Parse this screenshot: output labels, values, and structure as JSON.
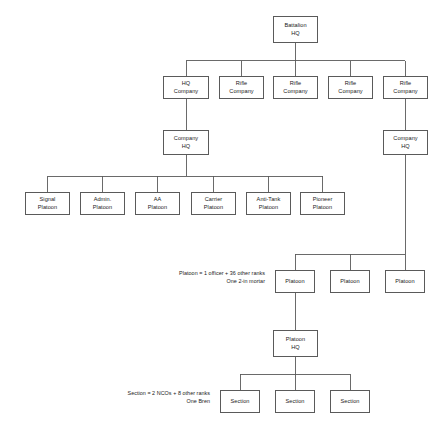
{
  "diagram": {
    "line_color": "#5a5a5a",
    "text_color": "#1a1a1a",
    "background": "#ffffff"
  },
  "nodes": {
    "battalion_hq": {
      "line1": "Battalion",
      "line2": "HQ"
    },
    "hq_company": {
      "line1": "HQ",
      "line2": "Company"
    },
    "rifle_company_1": {
      "line1": "Rifle",
      "line2": "Company"
    },
    "rifle_company_2": {
      "line1": "Rifle",
      "line2": "Company"
    },
    "rifle_company_3": {
      "line1": "Rifle",
      "line2": "Company"
    },
    "rifle_company_4": {
      "line1": "Rifle",
      "line2": "Company"
    },
    "company_hq_left": {
      "line1": "Company",
      "line2": "HQ"
    },
    "company_hq_right": {
      "line1": "Company",
      "line2": "HQ"
    },
    "signal_platoon": {
      "line1": "Signal",
      "line2": "Platoon"
    },
    "admin_platoon": {
      "line1": "Admin.",
      "line2": "Platoon"
    },
    "aa_platoon": {
      "line1": "AA",
      "line2": "Platoon"
    },
    "carrier_platoon": {
      "line1": "Carrier",
      "line2": "Platoon"
    },
    "antitank_platoon": {
      "line1": "Anti-Tank",
      "line2": "Platoon"
    },
    "pioneer_platoon": {
      "line1": "Pioneer",
      "line2": "Platoon"
    },
    "platoon_1": {
      "line1": "Platoon",
      "line2": ""
    },
    "platoon_2": {
      "line1": "Platoon",
      "line2": ""
    },
    "platoon_3": {
      "line1": "Platoon",
      "line2": ""
    },
    "platoon_hq": {
      "line1": "Platoon",
      "line2": "HQ"
    },
    "section_1": {
      "line1": "Section",
      "line2": ""
    },
    "section_2": {
      "line1": "Section",
      "line2": ""
    },
    "section_3": {
      "line1": "Section",
      "line2": ""
    }
  },
  "notes": {
    "platoon_note_line1": "Platoon = 1 officer + 36 other ranks",
    "platoon_note_line2": "One 2-in mortar",
    "section_note_line1": "Section = 2 NCOs + 8 other ranks",
    "section_note_line2": "One Bren"
  }
}
